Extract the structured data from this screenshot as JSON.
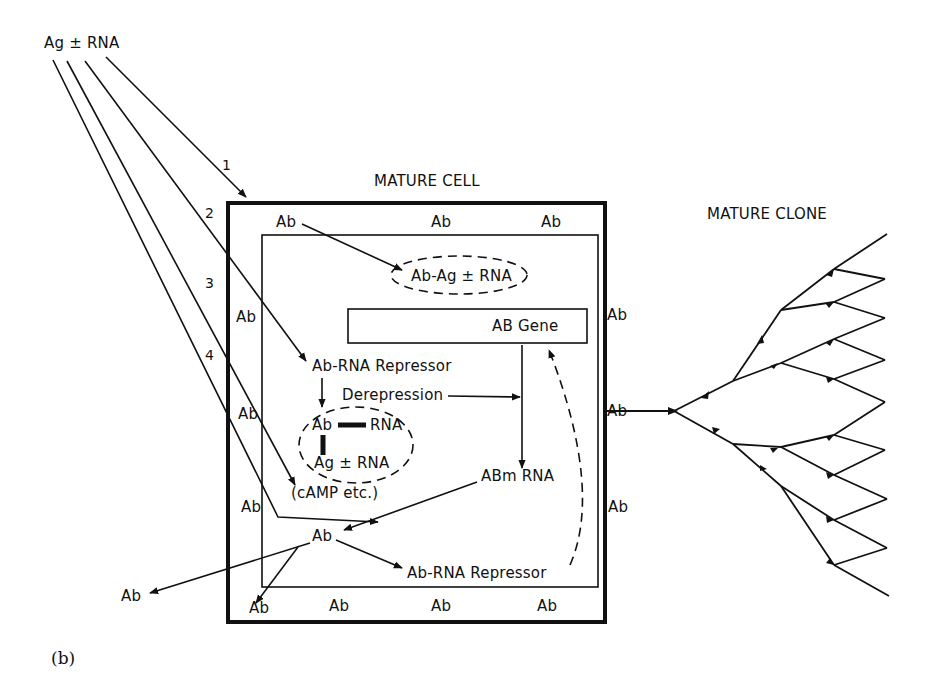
{
  "diagram": {
    "source_label": "Ag ± RNA",
    "pathway_numbers": [
      "1",
      "2",
      "3",
      "4"
    ],
    "mature_cell": {
      "title": "MATURE CELL",
      "membrane_ab_labels": {
        "top": [
          "Ab",
          "Ab",
          "Ab"
        ],
        "left": [
          "Ab",
          "Ab",
          "Ab"
        ],
        "right": [
          "Ab",
          "Ab",
          "Ab"
        ],
        "bottom": [
          "Ab",
          "Ab",
          "Ab",
          "Ab"
        ]
      },
      "complex_ellipse_top": "Ab-Ag ± RNA",
      "gene_box": "AB Gene",
      "repressor_top": "Ab-RNA Repressor",
      "derepression": "Derepression",
      "complex_ellipse_mid": {
        "ab": "Ab",
        "rna": "RNA",
        "ag": "Ag ± RNA"
      },
      "camp": "(cAMP etc.)",
      "abm_rna": "ABm RNA",
      "ab_center": "Ab",
      "repressor_bottom": "Ab-RNA Repressor",
      "ab_outside": "Ab"
    },
    "mature_clone": {
      "title": "MATURE CLONE"
    },
    "caption": "(b)"
  }
}
